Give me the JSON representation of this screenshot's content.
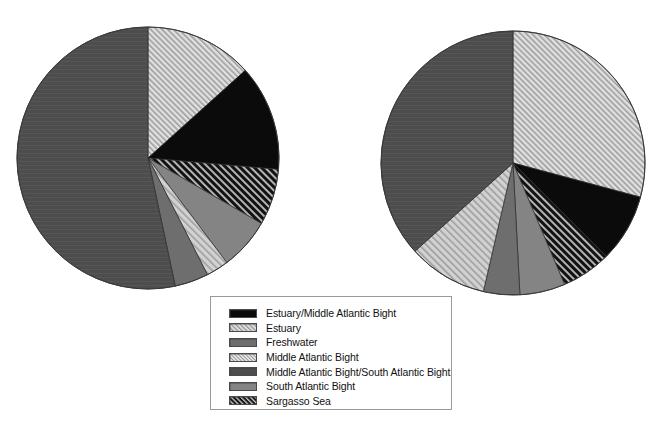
{
  "figure": {
    "type": "two-panel-pie",
    "background": "#ffffff",
    "width": 664,
    "height": 427
  },
  "legend": {
    "name": "chart-legend",
    "box": {
      "x": 210,
      "y": 296,
      "width": 242,
      "height": 114
    },
    "items": [
      {
        "label": "Estuary/Middle Atlantic Bight",
        "pattern": "solid-black",
        "color": "#0b0b0b"
      },
      {
        "label": "Estuary",
        "pattern": "hatch-light",
        "color": "#cfcfcf"
      },
      {
        "label": "Freshwater",
        "pattern": "solid-gray-medium",
        "color": "#6e6e6e"
      },
      {
        "label": "Middle Atlantic Bight",
        "pattern": "hatch-very-light",
        "color": "#d8d8d8"
      },
      {
        "label": "Middle Atlantic Bight/South Atlantic Bight",
        "pattern": "solid-gray-dark",
        "color": "#4a4a4a"
      },
      {
        "label": "South Atlantic Bight",
        "pattern": "solid-gray-mid",
        "color": "#808080"
      },
      {
        "label": "Sargasso Sea",
        "pattern": "hatch-dark",
        "color": "#1a1a1a"
      }
    ]
  },
  "chart_data": [
    {
      "type": "pie",
      "name": "left-pie",
      "title": "",
      "center": {
        "x": 148,
        "y": 158
      },
      "radius": 131,
      "start_angle_deg": 0,
      "direction": "clockwise",
      "categories": [
        "Middle Atlantic Bight",
        "Estuary/Middle Atlantic Bight",
        "Sargasso Sea",
        "South Atlantic Bight",
        "Estuary",
        "Freshwater",
        "Middle Atlantic Bight/South Atlantic Bight"
      ],
      "values": [
        13.3,
        13.1,
        6.9,
        6.4,
        2.8,
        4.2,
        53.3
      ],
      "angles_deg": [
        48,
        47,
        25,
        23,
        10,
        15,
        192
      ],
      "patterns": [
        "hatch-very-light",
        "solid-black",
        "hatch-dark",
        "solid-gray-mid",
        "hatch-light",
        "solid-gray-medium",
        "solid-gray-dark"
      ]
    },
    {
      "type": "pie",
      "name": "right-pie",
      "title": "",
      "center": {
        "x": 513,
        "y": 163
      },
      "radius": 132,
      "start_angle_deg": 0,
      "direction": "clockwise",
      "categories": [
        "Middle Atlantic Bight",
        "Estuary/Middle Atlantic Bight",
        "Sargasso Sea",
        "South Atlantic Bight",
        "Freshwater",
        "Estuary",
        "Middle Atlantic Bight/South Atlantic Bight"
      ],
      "values": [
        29.2,
        8.3,
        6.1,
        5.6,
        4.4,
        9.7,
        36.7
      ],
      "angles_deg": [
        105,
        30,
        22,
        20,
        16,
        35,
        132
      ],
      "patterns": [
        "hatch-very-light",
        "solid-black",
        "hatch-dark",
        "solid-gray-mid",
        "solid-gray-medium",
        "hatch-light",
        "solid-gray-dark"
      ]
    }
  ]
}
